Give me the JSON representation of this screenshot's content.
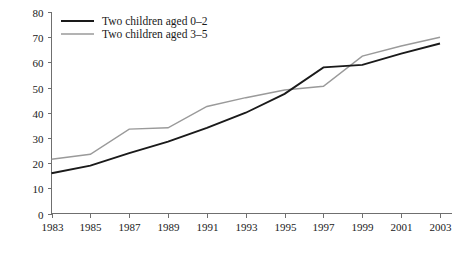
{
  "chart_data": {
    "type": "line",
    "title": "",
    "subtitle": "",
    "xlabel": "",
    "ylabel": "",
    "x": [
      1983,
      1985,
      1987,
      1989,
      1991,
      1993,
      1995,
      1997,
      1999,
      2001,
      2003
    ],
    "xtick_labels": [
      "1983",
      "1985",
      "1987",
      "1989",
      "1991",
      "1993",
      "1995",
      "1997",
      "1999",
      "2001",
      "2003"
    ],
    "ytick_labels": [
      "0",
      "10",
      "20",
      "30",
      "40",
      "50",
      "60",
      "70",
      "80"
    ],
    "yticks": [
      0,
      10,
      20,
      30,
      40,
      50,
      60,
      70,
      80
    ],
    "xlim": [
      1983,
      2003
    ],
    "ylim": [
      0,
      80
    ],
    "grid": false,
    "legend_position": "top-left",
    "series": [
      {
        "name": "Two children aged 0–2",
        "color": "#1a1a1a",
        "width": 1.9,
        "values": [
          16,
          19,
          24,
          28.5,
          34,
          40,
          47.5,
          58,
          59,
          63.5,
          67.5
        ]
      },
      {
        "name": "Two children aged 3–5",
        "color": "#9a9a9a",
        "width": 1.5,
        "values": [
          21.5,
          23.5,
          33.5,
          34,
          42.5,
          46,
          49,
          50.5,
          62.5,
          66.5,
          70
        ]
      }
    ]
  },
  "legend": {
    "entries": [
      {
        "label": "Two children aged 0–2"
      },
      {
        "label": "Two children aged 3–5"
      }
    ]
  },
  "axes": {
    "axis_color": "#6f6f6f"
  }
}
